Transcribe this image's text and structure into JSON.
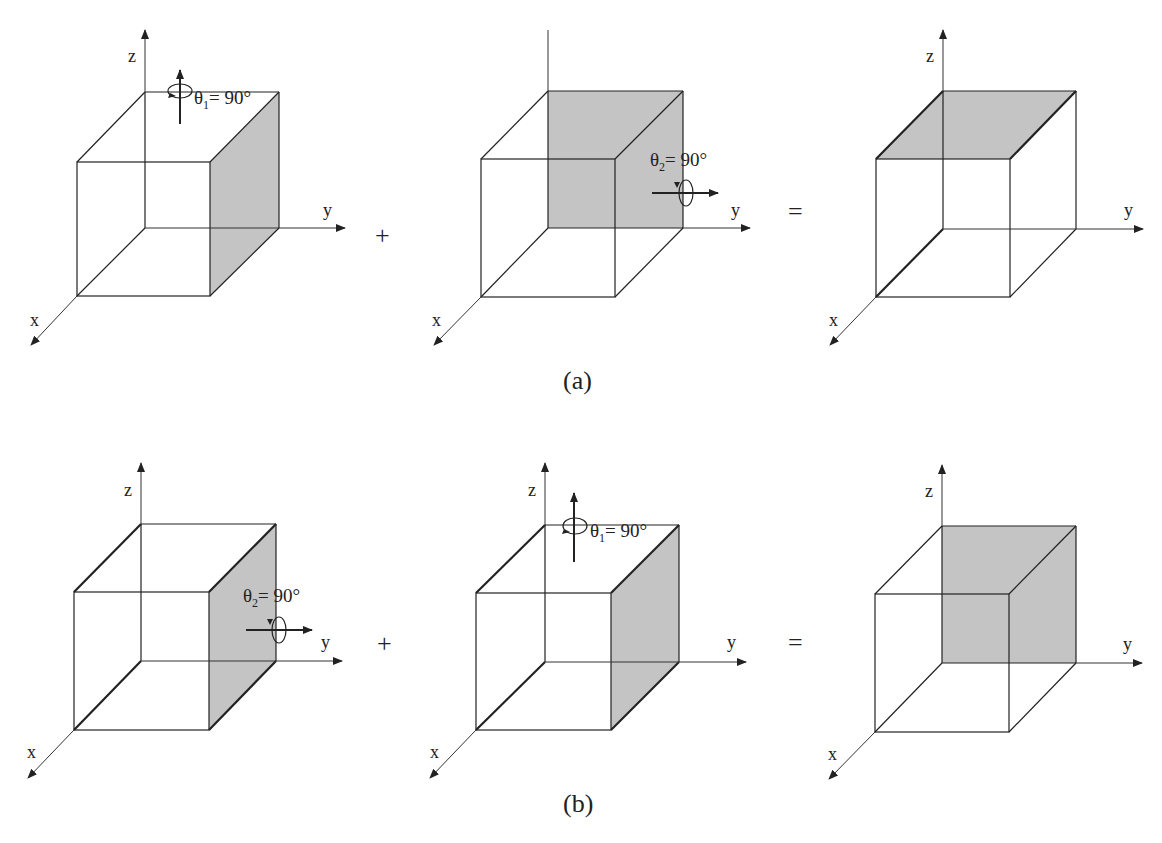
{
  "figure": {
    "rows": [
      {
        "caption": "(a)",
        "operators": [
          "+",
          "="
        ],
        "cubes": [
          {
            "shaded_face": "front-right (y = 1 face)",
            "rotation": {
              "symbol": "θ",
              "subscript": "1",
              "value": "= 90°",
              "axis": "z"
            }
          },
          {
            "shaded_face": "back (x = 0 face)",
            "rotation": {
              "symbol": "θ",
              "subscript": "2",
              "value": "= 90°",
              "axis": "y"
            }
          },
          {
            "shaded_face": "top (z = 1 face)",
            "rotation": null
          }
        ]
      },
      {
        "caption": "(b)",
        "operators": [
          "+",
          "="
        ],
        "cubes": [
          {
            "shaded_face": "front-right (y = 1 face)",
            "rotation": {
              "symbol": "θ",
              "subscript": "2",
              "value": "= 90°",
              "axis": "y"
            }
          },
          {
            "shaded_face": "front-right (y = 1 face)",
            "rotation": {
              "symbol": "θ",
              "subscript": "1",
              "value": "= 90°",
              "axis": "z"
            }
          },
          {
            "shaded_face": "back (x = 0 face)",
            "rotation": null
          }
        ]
      }
    ],
    "axis_labels": {
      "x": "x",
      "y": "y",
      "z": "z"
    },
    "colors": {
      "shade": "#c4c4c4",
      "line": "#222222"
    }
  }
}
